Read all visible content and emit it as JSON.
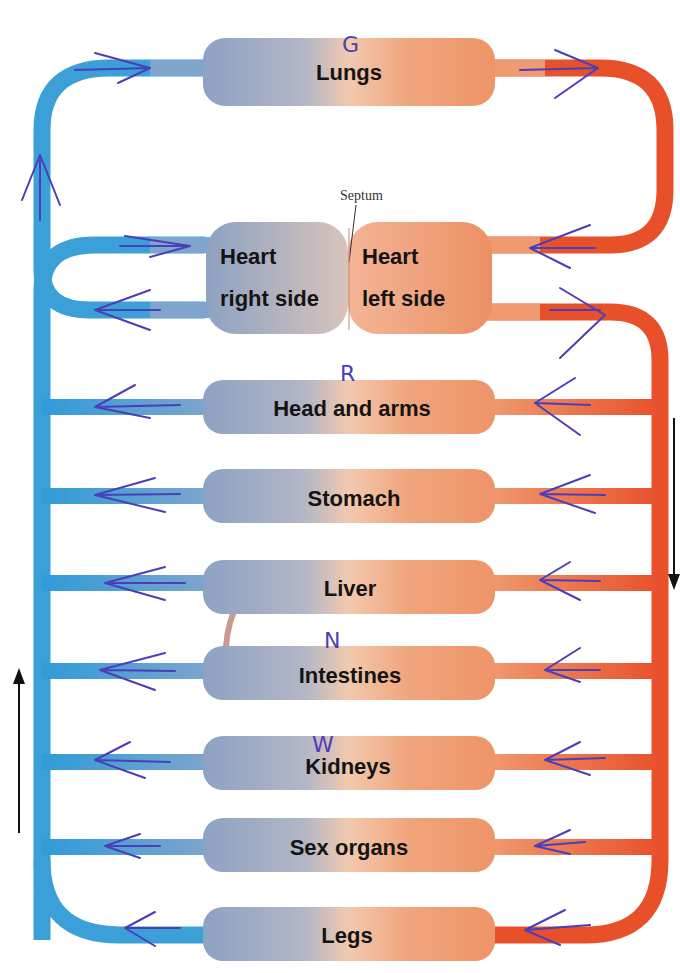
{
  "diagram": {
    "colors": {
      "deoxygenated": "#2f9bd9",
      "oxygenated": "#e8502a",
      "organ_left": "#8ea3c4",
      "organ_right": "#ef9a70",
      "annotation_pen": "#4a3fb8",
      "direction_arrow": "#111111"
    },
    "septum_label": "Septum",
    "heart": {
      "right_side": {
        "line1": "Heart",
        "line2": "right side"
      },
      "left_side": {
        "line1": "Heart",
        "line2": "left side"
      }
    },
    "organs": [
      {
        "id": "lungs",
        "label": "Lungs",
        "annotation": "G"
      },
      {
        "id": "head-and-arms",
        "label": "Head and arms",
        "annotation": "R"
      },
      {
        "id": "stomach",
        "label": "Stomach",
        "annotation": ""
      },
      {
        "id": "liver",
        "label": "Liver",
        "annotation": ""
      },
      {
        "id": "intestines",
        "label": "Intestines",
        "annotation": "N"
      },
      {
        "id": "kidneys",
        "label": "Kidneys",
        "annotation": "W"
      },
      {
        "id": "sex-organs",
        "label": "Sex organs",
        "annotation": ""
      },
      {
        "id": "legs",
        "label": "Legs",
        "annotation": ""
      }
    ],
    "direction_arrows": {
      "right_side": "down",
      "left_side": "up"
    }
  }
}
